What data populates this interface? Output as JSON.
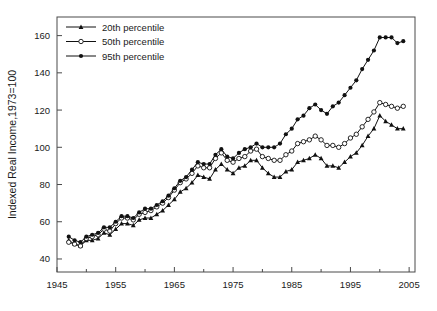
{
  "chart_data": {
    "type": "line",
    "title": "",
    "subtitle": "",
    "xlabel": "",
    "ylabel": "Indexed Real Income,1973=100",
    "xlim": [
      1945,
      2006
    ],
    "ylim": [
      33,
      170
    ],
    "grid": false,
    "legend_position": "top-left",
    "x_ticks": [
      1945,
      1955,
      1965,
      1975,
      1985,
      1995,
      2005
    ],
    "x_minor_ticks": [
      1950,
      1960,
      1970,
      1980,
      1990,
      2000
    ],
    "y_ticks": [
      40,
      60,
      80,
      100,
      120,
      140,
      160
    ],
    "x": [
      1947,
      1948,
      1949,
      1950,
      1951,
      1952,
      1953,
      1954,
      1955,
      1956,
      1957,
      1958,
      1959,
      1960,
      1961,
      1962,
      1963,
      1964,
      1965,
      1966,
      1967,
      1968,
      1969,
      1970,
      1971,
      1972,
      1973,
      1974,
      1975,
      1976,
      1977,
      1978,
      1979,
      1980,
      1981,
      1982,
      1983,
      1984,
      1985,
      1986,
      1987,
      1988,
      1989,
      1990,
      1991,
      1992,
      1993,
      1994,
      1995,
      1996,
      1997,
      1998,
      1999,
      2000,
      2001,
      2002,
      2003,
      2004
    ],
    "series": [
      {
        "name": "20th percentile",
        "marker": "triangle-filled",
        "values": [
          50,
          48,
          47,
          50,
          50,
          51,
          54,
          53,
          56,
          59,
          59,
          58,
          61,
          62,
          62,
          64,
          66,
          69,
          72,
          76,
          78,
          81,
          85,
          84,
          83,
          88,
          91,
          88,
          86,
          89,
          90,
          93,
          93,
          89,
          86,
          84,
          84,
          87,
          88,
          92,
          93,
          94,
          96,
          94,
          90,
          90,
          89,
          92,
          95,
          97,
          101,
          106,
          110,
          117,
          114,
          112,
          110,
          110
        ]
      },
      {
        "name": "50th percentile",
        "marker": "circle-open",
        "values": [
          49,
          48,
          47,
          51,
          52,
          53,
          56,
          55,
          59,
          62,
          62,
          61,
          64,
          65,
          66,
          68,
          70,
          73,
          77,
          81,
          83,
          86,
          90,
          89,
          89,
          94,
          97,
          93,
          92,
          94,
          95,
          98,
          99,
          95,
          94,
          93,
          93,
          96,
          98,
          102,
          103,
          104,
          106,
          104,
          101,
          101,
          100,
          102,
          105,
          107,
          111,
          115,
          119,
          124,
          123,
          122,
          121,
          122
        ]
      },
      {
        "name": "95th percentile",
        "marker": "circle-filled",
        "values": [
          52,
          50,
          49,
          52,
          53,
          54,
          57,
          57,
          60,
          63,
          63,
          62,
          65,
          67,
          67,
          69,
          71,
          74,
          78,
          82,
          84,
          88,
          92,
          91,
          91,
          96,
          99,
          95,
          94,
          97,
          99,
          100,
          102,
          100,
          100,
          100,
          102,
          107,
          110,
          115,
          117,
          121,
          123,
          120,
          118,
          122,
          124,
          128,
          132,
          136,
          142,
          147,
          152,
          159,
          159,
          159,
          156,
          157
        ]
      }
    ]
  },
  "legend": {
    "entries": [
      {
        "label": "20th percentile"
      },
      {
        "label": "50th percentile"
      },
      {
        "label": "95th percentile"
      }
    ]
  },
  "colors": {
    "line": "#111111",
    "axis": "#4a4a4a",
    "background": "#ffffff"
  }
}
